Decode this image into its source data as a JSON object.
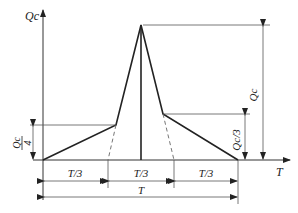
{
  "diagram": {
    "title": "",
    "axes": {
      "y_label": "Qc",
      "x_label": "T"
    },
    "curve": {
      "description": "Load profile: linear rise to Qc/4 over first T/3, sharp peak Qc at T/2, drop to Qc/3 at 2T/3, linear decline to 0 at T",
      "points": [
        {
          "t": "0",
          "q": "0"
        },
        {
          "t": "T/3",
          "q": "Qc/4"
        },
        {
          "t": "T/2",
          "q": "Qc"
        },
        {
          "t": "2T/3",
          "q": "Qc/3"
        },
        {
          "t": "T",
          "q": "0"
        }
      ]
    },
    "dimensions": {
      "left_height": {
        "numerator": "Qc",
        "denominator": "4"
      },
      "right_height": "Qc/3",
      "peak_height": "Qc",
      "segments": [
        "T/3",
        "T/3",
        "T/3"
      ],
      "total": "T"
    }
  }
}
